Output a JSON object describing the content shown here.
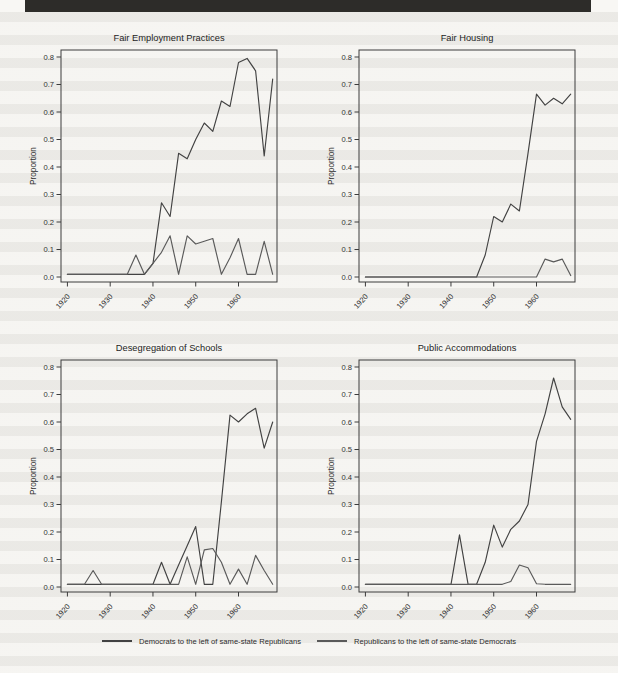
{
  "page": {
    "background_color": "#f8f7f4",
    "stripe_color": "#8a877e",
    "top_bar_color": "#2d2c29",
    "axis_color": "#3c3c3c"
  },
  "legend": {
    "items": [
      {
        "label": "Democrats to the left of same-state Republicans",
        "color": "#424242"
      },
      {
        "label": "Republicans to the left of same-state Democrats",
        "color": "#5a5a5a"
      }
    ]
  },
  "chart_data": [
    {
      "type": "line",
      "title": "Fair Employment Practices",
      "xlabel": "",
      "ylabel": "Proportion",
      "xlim": [
        1918.5,
        1969
      ],
      "ylim": [
        0,
        0.8
      ],
      "grid": false,
      "legend_position": "bottom-of-page",
      "x_ticks": [
        "1920",
        "1930",
        "1940",
        "1950",
        "1960"
      ],
      "y_ticks": [
        "0.0",
        "0.1",
        "0.2",
        "0.3",
        "0.4",
        "0.5",
        "0.6",
        "0.7",
        "0.8"
      ],
      "x": [
        1920,
        1922,
        1924,
        1926,
        1928,
        1930,
        1932,
        1934,
        1936,
        1938,
        1940,
        1942,
        1944,
        1946,
        1948,
        1950,
        1952,
        1954,
        1956,
        1958,
        1960,
        1962,
        1964,
        1966,
        1968
      ],
      "series": [
        {
          "name": "Democrats to the left of same-state Republicans",
          "color": "#424242",
          "values": [
            0.01,
            0.01,
            0.01,
            0.01,
            0.01,
            0.01,
            0.01,
            0.01,
            0.01,
            0.01,
            0.05,
            0.27,
            0.22,
            0.45,
            0.43,
            0.5,
            0.56,
            0.53,
            0.64,
            0.62,
            0.78,
            0.795,
            0.75,
            0.44,
            0.72
          ]
        },
        {
          "name": "Republicans to the left of same-state Democrats",
          "color": "#5a5a5a",
          "values": [
            0.01,
            0.01,
            0.01,
            0.01,
            0.01,
            0.01,
            0.01,
            0.01,
            0.08,
            0.01,
            0.05,
            0.09,
            0.15,
            0.01,
            0.15,
            0.12,
            0.13,
            0.14,
            0.01,
            0.07,
            0.14,
            0.01,
            0.01,
            0.13,
            0.01
          ]
        }
      ]
    },
    {
      "type": "line",
      "title": "Fair Housing",
      "xlabel": "",
      "ylabel": "Proportion",
      "xlim": [
        1918.5,
        1969
      ],
      "ylim": [
        0,
        0.8
      ],
      "grid": false,
      "legend_position": "bottom-of-page",
      "x_ticks": [
        "1920",
        "1930",
        "1940",
        "1950",
        "1960"
      ],
      "y_ticks": [
        "0.0",
        "0.1",
        "0.2",
        "0.3",
        "0.4",
        "0.5",
        "0.6",
        "0.7",
        "0.8"
      ],
      "x": [
        1920,
        1922,
        1924,
        1926,
        1928,
        1930,
        1932,
        1934,
        1936,
        1938,
        1940,
        1942,
        1944,
        1946,
        1948,
        1950,
        1952,
        1954,
        1956,
        1958,
        1960,
        1962,
        1964,
        1966,
        1968
      ],
      "series": [
        {
          "name": "Democrats to the left of same-state Republicans",
          "color": "#424242",
          "values": [
            0,
            0,
            0,
            0,
            0,
            0,
            0,
            0,
            0,
            0,
            0,
            0,
            0,
            0,
            0.08,
            0.22,
            0.2,
            0.265,
            0.24,
            0.45,
            0.665,
            0.625,
            0.65,
            0.63,
            0.665
          ]
        },
        {
          "name": "Republicans to the left of same-state Democrats",
          "color": "#5a5a5a",
          "values": [
            0,
            0,
            0,
            0,
            0,
            0,
            0,
            0,
            0,
            0,
            0,
            0,
            0,
            0,
            0,
            0,
            0,
            0,
            0,
            0,
            0,
            0.065,
            0.055,
            0.065,
            0.005
          ]
        }
      ]
    },
    {
      "type": "line",
      "title": "Desegregation of Schools",
      "xlabel": "",
      "ylabel": "Proportion",
      "xlim": [
        1918.5,
        1969
      ],
      "ylim": [
        0,
        0.8
      ],
      "grid": false,
      "legend_position": "bottom-of-page",
      "x_ticks": [
        "1920",
        "1930",
        "1940",
        "1950",
        "1960"
      ],
      "y_ticks": [
        "0.0",
        "0.1",
        "0.2",
        "0.3",
        "0.4",
        "0.5",
        "0.6",
        "0.7",
        "0.8"
      ],
      "x": [
        1920,
        1922,
        1924,
        1926,
        1928,
        1930,
        1932,
        1934,
        1936,
        1938,
        1940,
        1942,
        1944,
        1946,
        1948,
        1950,
        1952,
        1954,
        1956,
        1958,
        1960,
        1962,
        1964,
        1966,
        1968
      ],
      "series": [
        {
          "name": "Democrats to the left of same-state Republicans",
          "color": "#424242",
          "values": [
            0.01,
            0.01,
            0.01,
            0.01,
            0.01,
            0.01,
            0.01,
            0.01,
            0.01,
            0.01,
            0.01,
            0.09,
            0.01,
            0.08,
            0.15,
            0.22,
            0.01,
            0.01,
            0.31,
            0.625,
            0.6,
            0.63,
            0.65,
            0.505,
            0.6
          ]
        },
        {
          "name": "Republicans to the left of same-state Democrats",
          "color": "#5a5a5a",
          "values": [
            0.01,
            0.01,
            0.01,
            0.06,
            0.01,
            0.01,
            0.01,
            0.01,
            0.01,
            0.01,
            0.01,
            0.01,
            0.01,
            0.01,
            0.11,
            0.01,
            0.135,
            0.14,
            0.09,
            0.01,
            0.065,
            0.01,
            0.115,
            0.06,
            0.01
          ]
        }
      ]
    },
    {
      "type": "line",
      "title": "Public Accommodations",
      "xlabel": "",
      "ylabel": "Proportion",
      "xlim": [
        1918.5,
        1969
      ],
      "ylim": [
        0,
        0.8
      ],
      "grid": false,
      "legend_position": "bottom-of-page",
      "x_ticks": [
        "1920",
        "1930",
        "1940",
        "1950",
        "1960"
      ],
      "y_ticks": [
        "0.0",
        "0.1",
        "0.2",
        "0.3",
        "0.4",
        "0.5",
        "0.6",
        "0.7",
        "0.8"
      ],
      "x": [
        1920,
        1922,
        1924,
        1926,
        1928,
        1930,
        1932,
        1934,
        1936,
        1938,
        1940,
        1942,
        1944,
        1946,
        1948,
        1950,
        1952,
        1954,
        1956,
        1958,
        1960,
        1962,
        1964,
        1966,
        1968
      ],
      "series": [
        {
          "name": "Democrats to the left of same-state Republicans",
          "color": "#424242",
          "values": [
            0.01,
            0.01,
            0.01,
            0.01,
            0.01,
            0.01,
            0.01,
            0.01,
            0.01,
            0.01,
            0.01,
            0.19,
            0.01,
            0.01,
            0.09,
            0.225,
            0.145,
            0.21,
            0.24,
            0.3,
            0.53,
            0.63,
            0.76,
            0.655,
            0.61
          ]
        },
        {
          "name": "Republicans to the left of same-state Democrats",
          "color": "#5a5a5a",
          "values": [
            0.01,
            0.01,
            0.01,
            0.01,
            0.01,
            0.01,
            0.01,
            0.01,
            0.01,
            0.01,
            0.01,
            0.01,
            0.01,
            0.01,
            0.01,
            0.01,
            0.01,
            0.02,
            0.08,
            0.07,
            0.012,
            0.01,
            0.01,
            0.01,
            0.01
          ]
        }
      ]
    }
  ]
}
